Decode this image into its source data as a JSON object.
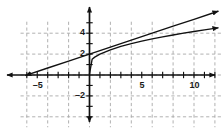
{
  "chart_data": {
    "type": "line",
    "title": "",
    "xlabel": "",
    "ylabel": "",
    "xlim": [
      -6.6,
      12.6
    ],
    "ylim": [
      -5.0,
      5.1
    ],
    "grid": true,
    "grid_style": "dashed",
    "grid_spacing": 2,
    "grid_color": "#a8a8a8",
    "axis_color": "#111111",
    "curve_color": "#111111",
    "tick_spacing": 1,
    "legend": "none",
    "x_tick_labels": [
      {
        "value": -5,
        "text": "–5"
      },
      {
        "value": 5,
        "text": "5"
      },
      {
        "value": 10,
        "text": "10"
      }
    ],
    "y_tick_labels": [
      {
        "value": 4,
        "text": "4"
      },
      {
        "value": 2,
        "text": "2"
      },
      {
        "value": -2,
        "text": "–2"
      }
    ],
    "series": [
      {
        "name": "line",
        "type": "line",
        "equation": "y = x/3 + 2",
        "slope": 0.3333,
        "intercept": 2,
        "x_start": -6.1,
        "x_end": 12.3,
        "arrow_start": true,
        "arrow_end": true,
        "points": [
          {
            "x": -6.1,
            "y": -0.03
          },
          {
            "x": -4.0,
            "y": 0.67
          },
          {
            "x": -2.0,
            "y": 1.33
          },
          {
            "x": 0.0,
            "y": 2.0
          },
          {
            "x": 2.0,
            "y": 2.67
          },
          {
            "x": 4.0,
            "y": 3.33
          },
          {
            "x": 6.0,
            "y": 4.0
          },
          {
            "x": 8.0,
            "y": 4.67
          },
          {
            "x": 10.0,
            "y": 5.33
          },
          {
            "x": 12.3,
            "y": 6.1
          }
        ]
      },
      {
        "name": "radical",
        "type": "curve",
        "equation": "y = sqrt(x) + 1",
        "x_start": 0.0,
        "x_end": 12.3,
        "arrow_start": false,
        "arrow_end": true,
        "points": [
          {
            "x": 0.0,
            "y": 0.1
          },
          {
            "x": 0.25,
            "y": 1.5
          },
          {
            "x": 0.5,
            "y": 1.71
          },
          {
            "x": 1.0,
            "y": 2.0
          },
          {
            "x": 2.0,
            "y": 2.41
          },
          {
            "x": 3.0,
            "y": 2.73
          },
          {
            "x": 4.0,
            "y": 3.0
          },
          {
            "x": 5.0,
            "y": 3.24
          },
          {
            "x": 6.0,
            "y": 3.45
          },
          {
            "x": 7.0,
            "y": 3.65
          },
          {
            "x": 8.0,
            "y": 3.83
          },
          {
            "x": 9.0,
            "y": 4.0
          },
          {
            "x": 10.0,
            "y": 4.16
          },
          {
            "x": 11.0,
            "y": 4.32
          },
          {
            "x": 12.3,
            "y": 4.51
          }
        ]
      }
    ]
  }
}
